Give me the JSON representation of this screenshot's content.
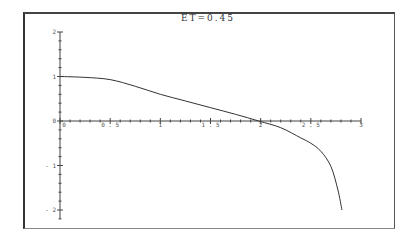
{
  "chart_data": {
    "type": "line",
    "title": "ET=0.45",
    "xlabel": "",
    "ylabel": "",
    "xlim": [
      0,
      3
    ],
    "ylim": [
      -2.2,
      2
    ],
    "x_ticks": [
      "0",
      "0.5",
      "1",
      "1.5",
      "2",
      "2.5",
      "3"
    ],
    "y_ticks": [
      "2",
      "1",
      "0",
      "-1",
      "-2"
    ],
    "grid": false,
    "legend": null,
    "series": [
      {
        "name": "curve",
        "x": [
          0,
          0.25,
          0.5,
          0.75,
          1.0,
          1.25,
          1.5,
          1.75,
          1.98,
          2.2,
          2.4,
          2.5,
          2.6,
          2.7,
          2.77,
          2.81
        ],
        "y": [
          1.0,
          0.98,
          0.93,
          0.78,
          0.6,
          0.45,
          0.3,
          0.15,
          0.0,
          -0.15,
          -0.38,
          -0.5,
          -0.68,
          -1.02,
          -1.55,
          -2.0
        ]
      }
    ]
  },
  "title": "ET=0.45"
}
